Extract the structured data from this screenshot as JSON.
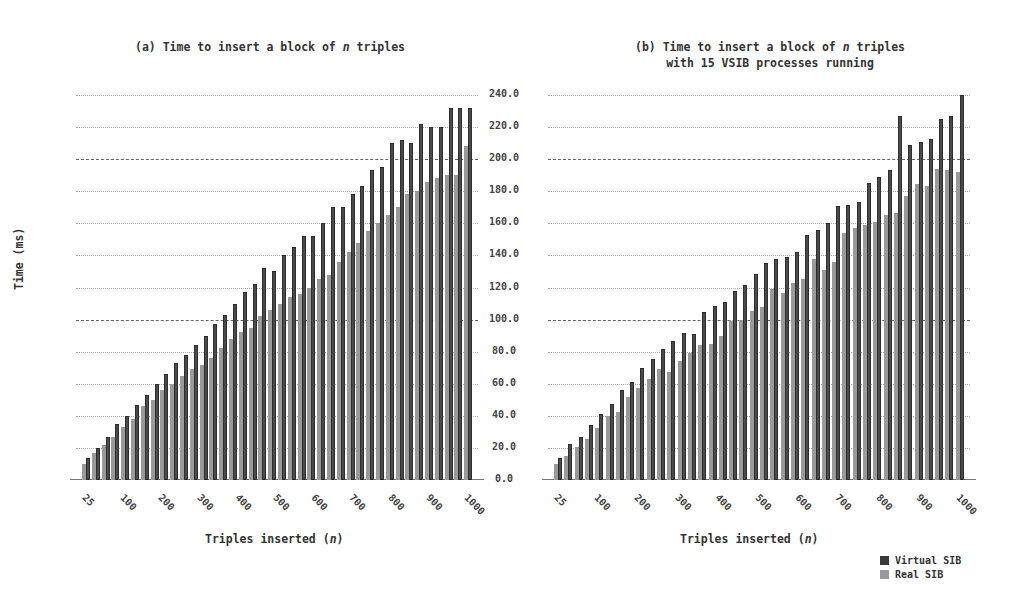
{
  "chart_data": [
    {
      "type": "bar",
      "title": "(a) Time to insert a block of n triples",
      "xlabel": "Triples inserted (n)",
      "ylabel": "Time (ms)",
      "ylim": [
        0,
        240
      ],
      "yticks": [
        "0.0",
        "20.0",
        "40.0",
        "60.0",
        "80.0",
        "100.0",
        "120.0",
        "140.0",
        "160.0",
        "180.0",
        "200.0",
        "220.0",
        "240.0"
      ],
      "xtick_labels": [
        "25",
        "100",
        "200",
        "300",
        "400",
        "500",
        "600",
        "700",
        "800",
        "900",
        "1000"
      ],
      "categories": [
        25,
        50,
        75,
        100,
        125,
        150,
        175,
        200,
        225,
        250,
        275,
        300,
        325,
        350,
        375,
        400,
        425,
        450,
        475,
        500,
        525,
        550,
        575,
        600,
        625,
        650,
        675,
        700,
        725,
        750,
        775,
        800,
        825,
        850,
        875,
        900,
        925,
        950,
        975,
        1000
      ],
      "series": [
        {
          "name": "Virtual SIB",
          "color": "#4a4a4a",
          "values": [
            14,
            20,
            27,
            35,
            40,
            47,
            53,
            60,
            66,
            73,
            78,
            84,
            90,
            97,
            103,
            110,
            117,
            122,
            132,
            130,
            140,
            145,
            152,
            152,
            160,
            170,
            170,
            178,
            183,
            193,
            195,
            210,
            212,
            210,
            222,
            220,
            220,
            232,
            232,
            232
          ]
        },
        {
          "name": "Real SIB",
          "color": "#9a9a9a",
          "values": [
            10,
            17,
            22,
            27,
            33,
            38,
            46,
            50,
            56,
            60,
            65,
            69,
            72,
            76,
            82,
            88,
            92,
            95,
            102,
            106,
            110,
            114,
            116,
            120,
            125,
            128,
            136,
            142,
            148,
            155,
            160,
            165,
            170,
            178,
            180,
            186,
            188,
            190,
            190,
            208
          ]
        }
      ],
      "grid": true,
      "legend_position": "bottom-right"
    },
    {
      "type": "bar",
      "title": "(b) Time to insert a block of n triples with 15 VSIB processes running",
      "xlabel": "Triples inserted (n)",
      "ylabel": "Time (ms)",
      "ylim": [
        0,
        240
      ],
      "yticks": [
        "0.0",
        "20.0",
        "40.0",
        "60.0",
        "80.0",
        "100.0",
        "120.0",
        "140.0",
        "160.0",
        "180.0",
        "200.0",
        "220.0",
        "240.0"
      ],
      "xtick_labels": [
        "25",
        "100",
        "200",
        "300",
        "400",
        "500",
        "600",
        "700",
        "800",
        "900",
        "1000"
      ],
      "categories": [
        25,
        50,
        75,
        100,
        125,
        150,
        175,
        200,
        225,
        250,
        275,
        300,
        325,
        350,
        375,
        400,
        425,
        450,
        475,
        500,
        525,
        550,
        575,
        600,
        625,
        650,
        675,
        700,
        725,
        750,
        775,
        800,
        825,
        850,
        875,
        900,
        925,
        950,
        975,
        1000
      ],
      "series": [
        {
          "name": "Virtual SIB",
          "color": "#4a4a4a",
          "values": [
            13.5,
            22.5,
            27,
            34,
            41,
            47.5,
            56,
            61,
            70,
            75.5,
            81.5,
            86.5,
            91.5,
            91,
            105,
            108.5,
            111,
            118,
            121.5,
            128.5,
            135.5,
            138,
            139,
            142,
            152.5,
            156,
            160,
            171,
            171.5,
            173,
            185,
            189,
            193.5,
            227,
            209,
            211,
            212.5,
            225,
            227,
            240
          ]
        },
        {
          "name": "Real SIB",
          "color": "#9a9a9a",
          "values": [
            10,
            15,
            20.5,
            25.5,
            32.5,
            40,
            42.5,
            52,
            57.5,
            63,
            69,
            67.5,
            74,
            79,
            84,
            85,
            89.5,
            99,
            99.5,
            105.5,
            108,
            119,
            116.5,
            123,
            125,
            138,
            131,
            136,
            154,
            157,
            159,
            161,
            165,
            166.5,
            177,
            184.5,
            183,
            194,
            193,
            192
          ]
        }
      ],
      "grid": true,
      "legend_position": "bottom-right"
    }
  ],
  "titles": {
    "a_prefix": "(a) Time to insert a block of ",
    "a_var": "n",
    "a_suffix": " triples",
    "b_line1_prefix": "(b) Time to insert a block of ",
    "b_var": "n",
    "b_line1_suffix": " triples",
    "b_line2": "with 15 VSIB processes running"
  },
  "axes": {
    "ylabel": "Time (ms)",
    "xlabel_prefix": "Triples inserted (",
    "xlabel_var": "n",
    "xlabel_suffix": ")"
  },
  "legend": {
    "virtual": "Virtual SIB",
    "real": "Real SIB",
    "virtual_color": "#3a3a3a",
    "real_color": "#9a9a9a"
  }
}
